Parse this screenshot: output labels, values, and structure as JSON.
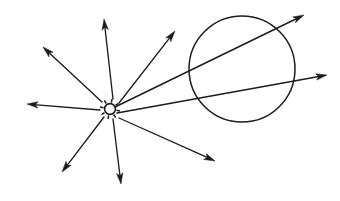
{
  "figure": {
    "title": "Point light source ray diagram",
    "background_color": "#ffffff",
    "stroke_color": "#1c1c1c",
    "width": 340,
    "height": 201
  },
  "source": {
    "name": "point-light-source",
    "symbol": "sun-icon",
    "x": 110,
    "y": 109,
    "body_radius": 5.4,
    "spike_count": 8,
    "spike_inner": 6.6,
    "spike_outer": 10.2
  },
  "lens": {
    "name": "circle-lens",
    "shape": "circle",
    "cx": 242,
    "cy": 69,
    "r": 53
  },
  "rays": [
    {
      "name": "ray-up",
      "label": "ray-up",
      "x1": 113,
      "y1": 99,
      "x2": 104,
      "y2": 19,
      "arrow": true,
      "through_lens": false
    },
    {
      "name": "ray-upper-left",
      "label": "ray-upper-left",
      "x1": 102,
      "y1": 102,
      "x2": 43,
      "y2": 47,
      "arrow": true,
      "through_lens": false
    },
    {
      "name": "ray-left",
      "label": "ray-left",
      "x1": 100,
      "y1": 110,
      "x2": 27,
      "y2": 104,
      "arrow": true,
      "through_lens": false
    },
    {
      "name": "ray-lower-left",
      "label": "ray-lower-left",
      "x1": 104,
      "y1": 117,
      "x2": 62,
      "y2": 172,
      "arrow": true,
      "through_lens": false
    },
    {
      "name": "ray-down",
      "label": "ray-down",
      "x1": 113,
      "y1": 119,
      "x2": 121,
      "y2": 184,
      "arrow": true,
      "through_lens": false
    },
    {
      "name": "ray-upper-right-short",
      "label": "ray-upper-right-short",
      "x1": 119,
      "y1": 103,
      "x2": 175,
      "y2": 31,
      "arrow": true,
      "through_lens": false
    },
    {
      "name": "ray-lower-right",
      "label": "ray-lower-right",
      "x1": 119,
      "y1": 118,
      "x2": 215,
      "y2": 161,
      "arrow": true,
      "through_lens": false
    },
    {
      "name": "ray-through-lens-upper",
      "label": "ray-through-lens-upper",
      "x1": 115,
      "y1": 107,
      "x2": 304,
      "y2": 15,
      "arrow": true,
      "through_lens": true
    },
    {
      "name": "ray-through-lens-lower",
      "label": "ray-through-lens-lower",
      "x1": 117,
      "y1": 113,
      "x2": 327,
      "y2": 75,
      "arrow": true,
      "through_lens": true
    }
  ],
  "arrow_style": {
    "length": 11,
    "half_width": 3.2,
    "notch": 2.6
  }
}
